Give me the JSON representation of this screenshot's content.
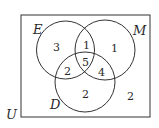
{
  "diagram": {
    "type": "venn",
    "universe_label": "U",
    "sets": [
      {
        "name": "E",
        "label": "E"
      },
      {
        "name": "M",
        "label": "M"
      },
      {
        "name": "D",
        "label": "D"
      }
    ],
    "regions": {
      "E_only": "3",
      "E_and_M_only": "1",
      "M_only": "1",
      "E_and_D_only": "2",
      "E_M_D": "5",
      "M_and_D_only": "4",
      "D_only": "2",
      "outside": "2"
    }
  }
}
